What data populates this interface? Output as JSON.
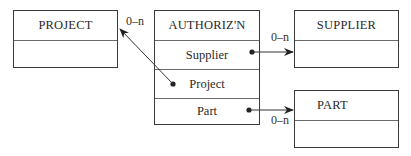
{
  "diagram": {
    "entities": {
      "project": {
        "title": "PROJECT"
      },
      "authorization": {
        "title": "AUTHORIZ'N",
        "fields": [
          "Supplier",
          "Project",
          "Part"
        ]
      },
      "supplier": {
        "title": "SUPPLIER"
      },
      "part": {
        "title": "PART"
      }
    },
    "cardinalities": {
      "authorization_to_project": "0–n",
      "authorization_to_supplier": "0–n",
      "authorization_to_part": "0–n"
    },
    "colors": {
      "line": "#333333",
      "border": "#3a3a3a"
    }
  }
}
